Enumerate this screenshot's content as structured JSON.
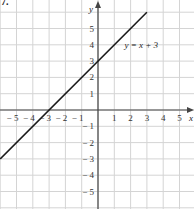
{
  "corner_label": "7.",
  "chart_data": {
    "type": "line",
    "title": "",
    "xlabel": "x",
    "ylabel": "y",
    "xlim": [
      -6,
      6
    ],
    "ylim": [
      -6,
      6
    ],
    "grid": true,
    "x_ticks": [
      "-5",
      "-4",
      "-3",
      "-2",
      "-1",
      "1",
      "2",
      "3",
      "4",
      "5"
    ],
    "y_ticks": [
      "5",
      "4",
      "3",
      "2",
      "1",
      "-1",
      "-2",
      "-3",
      "-4",
      "-5"
    ],
    "series": [
      {
        "name": "y = x + 3",
        "equation": "y = x + 3",
        "x": [
          -6,
          3
        ],
        "y": [
          -3,
          6
        ],
        "color": "#1a1a1a"
      }
    ],
    "annotations": [
      {
        "text": "y = x + 3",
        "x": 1.5,
        "y": 4
      }
    ],
    "axis_intercepts": {
      "x_intercept": -3,
      "y_intercept": 3
    }
  }
}
